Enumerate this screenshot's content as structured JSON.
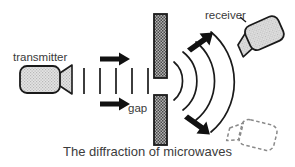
{
  "figure": {
    "caption": "The diffraction of microwaves",
    "labels": {
      "transmitter": "transmitter",
      "receiver": "receiver",
      "gap": "gap"
    },
    "colors": {
      "stroke": "#1a1a1a",
      "text": "#3a3a3a",
      "barrier_fill": "#8f8f8f",
      "device_fill": "#d8d8d8",
      "background": "#ffffff",
      "dashed_outline": "#8a8a8a"
    },
    "elements": {
      "transmitter_body": "microwave-transmitter",
      "transmitter_horn": "horn-antenna",
      "receiver_body": "microwave-receiver",
      "receiver_horn": "horn-antenna",
      "ghost_receiver": "receiver-alternate-position-dashed",
      "barrier_top": "metal-barrier-upper",
      "barrier_bottom": "metal-barrier-lower",
      "gap_opening": "slit-gap",
      "plane_wavefronts_count": 5,
      "circular_wavefronts_count": 4,
      "incident_arrows_count": 2,
      "diffracted_arrows_count": 2
    },
    "icon_names": {
      "arrow_right": "arrow-right-icon",
      "arrow_up_right": "arrow-up-right-icon",
      "arrow_down_right": "arrow-down-right-icon"
    }
  }
}
